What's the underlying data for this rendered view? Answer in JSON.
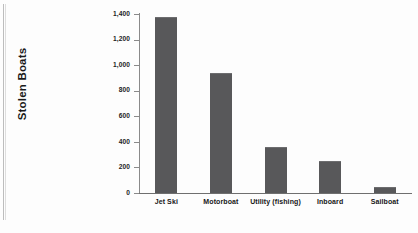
{
  "chart_data": {
    "type": "bar",
    "title": "",
    "xlabel": "",
    "ylabel": "Stolen Boats",
    "categories": [
      "Jet Ski",
      "Motorboat",
      "Utility (fishing)",
      "Inboard",
      "Sailboat"
    ],
    "values": [
      1380,
      940,
      360,
      250,
      50
    ],
    "ylim": [
      0,
      1400
    ],
    "yticks": [
      0,
      200,
      400,
      600,
      800,
      1000,
      1200,
      1400
    ],
    "ytick_labels": [
      "0",
      "200",
      "400",
      "600",
      "800",
      "1,000",
      "1,200",
      "1,400"
    ],
    "grid": false,
    "legend": false,
    "bar_color": "#58585a",
    "axis_color": "#6f6f6f",
    "background": "#ffffff"
  }
}
